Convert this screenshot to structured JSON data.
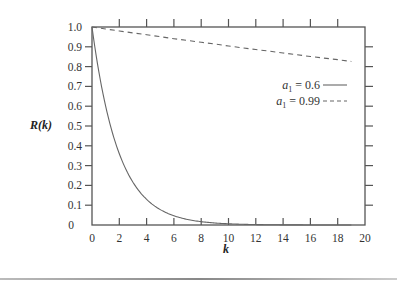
{
  "chart_data": {
    "type": "line",
    "title": "",
    "xlabel": "k",
    "ylabel": "R(k)",
    "xlim": [
      0,
      20
    ],
    "ylim": [
      0,
      1.0
    ],
    "x_ticks": [
      "0",
      "2",
      "4",
      "6",
      "8",
      "10",
      "12",
      "14",
      "16",
      "18",
      "20"
    ],
    "y_ticks": [
      "0",
      "0.1",
      "0.2",
      "0.3",
      "0.4",
      "0.5",
      "0.6",
      "0.7",
      "0.8",
      "0.9",
      "1.0"
    ],
    "grid": false,
    "legend_position": "upper-right (inside)",
    "x": [
      0,
      1,
      2,
      3,
      4,
      5,
      6,
      7,
      8,
      9,
      10,
      11,
      12,
      13,
      14,
      15,
      16,
      17,
      18,
      19
    ],
    "series": [
      {
        "name": "a1 = 0.6",
        "style": "solid",
        "values": [
          1.0,
          0.6,
          0.36,
          0.216,
          0.13,
          0.078,
          0.047,
          0.028,
          0.017,
          0.01,
          0.006,
          0.004,
          0.002,
          0.001,
          0.001,
          0.0,
          0.0,
          0.0,
          0.0,
          0.0
        ]
      },
      {
        "name": "a1 = 0.99",
        "style": "dashed",
        "values": [
          1.0,
          0.99,
          0.98,
          0.97,
          0.961,
          0.951,
          0.941,
          0.932,
          0.923,
          0.914,
          0.904,
          0.895,
          0.886,
          0.878,
          0.869,
          0.86,
          0.851,
          0.843,
          0.835,
          0.826
        ]
      }
    ]
  },
  "labels": {
    "ylabel": "R(k)",
    "xlabel": "k",
    "legend": [
      {
        "prefix": "a",
        "sub": "1",
        "text": " = 0.6",
        "style": "solid"
      },
      {
        "prefix": "a",
        "sub": "1",
        "text": " = 0.99",
        "style": "dashed"
      }
    ]
  }
}
